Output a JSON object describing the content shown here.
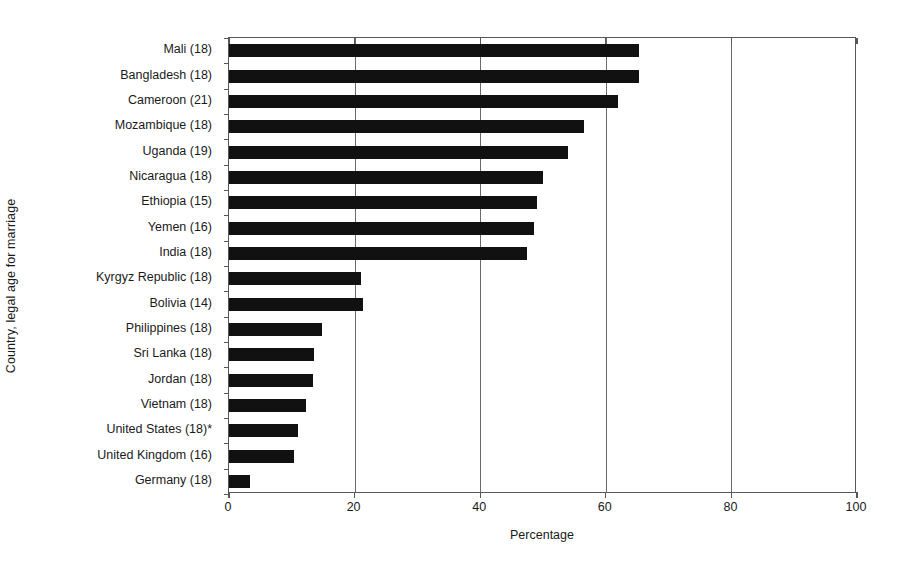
{
  "chart_data": {
    "type": "bar",
    "orientation": "horizontal",
    "title": "",
    "xlabel": "Percentage",
    "ylabel": "Country, legal age for marriage",
    "xlim": [
      0,
      100
    ],
    "xticks": [
      0,
      20,
      40,
      60,
      80,
      100
    ],
    "grid": true,
    "grid_axis": "x",
    "legend": false,
    "bar_color": "#111111",
    "categories": [
      "Mali (18)",
      "Bangladesh (18)",
      "Cameroon (21)",
      "Mozambique (18)",
      "Uganda (19)",
      "Nicaragua (18)",
      "Ethiopia (15)",
      "Yemen (16)",
      "India (18)",
      "Kyrgyz Republic (18)",
      "Bolivia (14)",
      "Philippines (18)",
      "Sri Lanka (18)",
      "Jordan (18)",
      "Vietnam (18)",
      "United States (18)*",
      "United Kingdom (16)",
      "Germany (18)"
    ],
    "values": [
      65.3,
      65.3,
      62.0,
      56.5,
      54.0,
      50.0,
      49.0,
      48.5,
      47.5,
      21.0,
      21.3,
      14.8,
      13.5,
      13.3,
      12.3,
      11.0,
      10.3,
      3.3
    ]
  }
}
